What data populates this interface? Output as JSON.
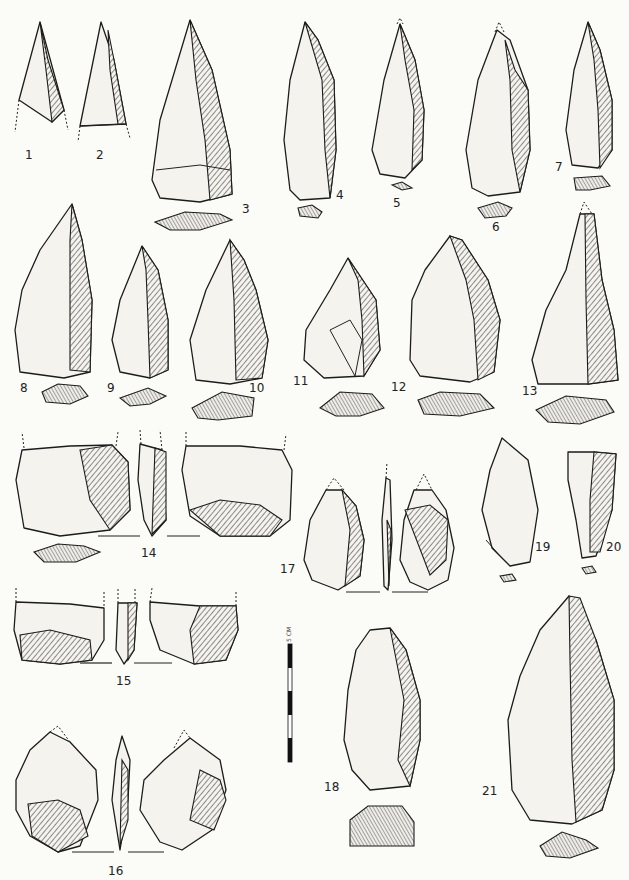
{
  "plate": {
    "subject": "Lithic artifact illustration plate",
    "scale_bar": {
      "label": "5 CM",
      "segments": 5
    },
    "figures": [
      {
        "id": 1,
        "label": "1"
      },
      {
        "id": 2,
        "label": "2"
      },
      {
        "id": 3,
        "label": "3"
      },
      {
        "id": 4,
        "label": "4"
      },
      {
        "id": 5,
        "label": "5"
      },
      {
        "id": 6,
        "label": "6"
      },
      {
        "id": 7,
        "label": "7"
      },
      {
        "id": 8,
        "label": "8"
      },
      {
        "id": 9,
        "label": "9"
      },
      {
        "id": 10,
        "label": "10"
      },
      {
        "id": 11,
        "label": "11"
      },
      {
        "id": 12,
        "label": "12"
      },
      {
        "id": 13,
        "label": "13"
      },
      {
        "id": 14,
        "label": "14"
      },
      {
        "id": 15,
        "label": "15"
      },
      {
        "id": 16,
        "label": "16"
      },
      {
        "id": 17,
        "label": "17"
      },
      {
        "id": 18,
        "label": "18"
      },
      {
        "id": 19,
        "label": "19"
      },
      {
        "id": 20,
        "label": "20"
      },
      {
        "id": 21,
        "label": "21"
      }
    ]
  }
}
